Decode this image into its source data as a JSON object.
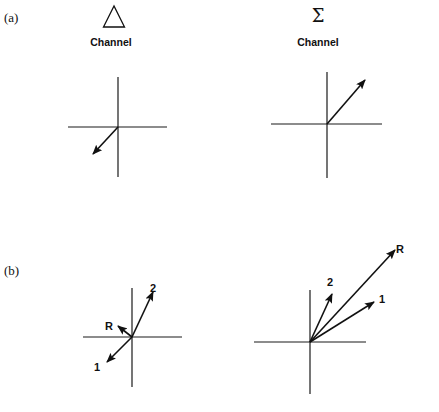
{
  "figure": {
    "part_a": {
      "label": "(a)",
      "delta_channel": {
        "symbol": "Δ",
        "symbol_name": "triangle-delta-icon",
        "label": "Channel",
        "vectors": [
          {
            "name": "signal",
            "direction": "down-left"
          }
        ]
      },
      "sum_channel": {
        "symbol": "Σ",
        "symbol_name": "sigma-icon",
        "label": "Channel",
        "vectors": [
          {
            "name": "signal",
            "direction": "up-right"
          }
        ]
      }
    },
    "part_b": {
      "label": "(b)",
      "delta_channel": {
        "vector_labels": {
          "v1": "1",
          "v2": "2",
          "resultant": "R"
        }
      },
      "sum_channel": {
        "vector_labels": {
          "v1": "1",
          "v2": "2",
          "resultant": "R"
        }
      }
    },
    "colors": {
      "ink": "#111111",
      "background": "#ffffff"
    }
  }
}
